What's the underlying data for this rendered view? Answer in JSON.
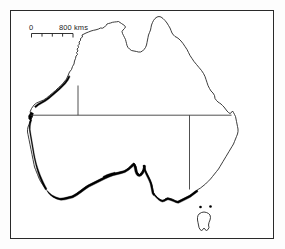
{
  "figure": {
    "type": "map",
    "region": "Australia",
    "background_color": "#ffffff",
    "frame_color": "#2a2a2a"
  },
  "scale_bar": {
    "zero_label": "0",
    "max_label": "800 kms",
    "unit": "kms",
    "min_value": 0,
    "max_value": 800,
    "tick_count": 4
  },
  "legend": {
    "thick_coast_meaning": "highlighted coastal zone",
    "thick_coast_color": "#000000",
    "coastline_color": "#1a1a1a",
    "state_border_color": "#3c3c3c"
  },
  "features": {
    "mainland_name": "Australia",
    "island_name": "Tasmania",
    "islets_count": 2
  }
}
